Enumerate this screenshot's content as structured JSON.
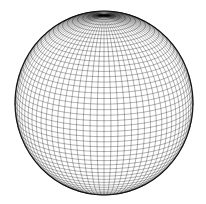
{
  "figure": {
    "type": "wireframe-sphere",
    "background": "#ffffff",
    "line_color": "#000000",
    "center": [
      104,
      103
    ],
    "radius_x": 89,
    "radius_y": 92,
    "meridians": 80,
    "parallels": 52,
    "tilt_deg": 18,
    "line_opacity": 0.55,
    "line_width": 0.55
  }
}
